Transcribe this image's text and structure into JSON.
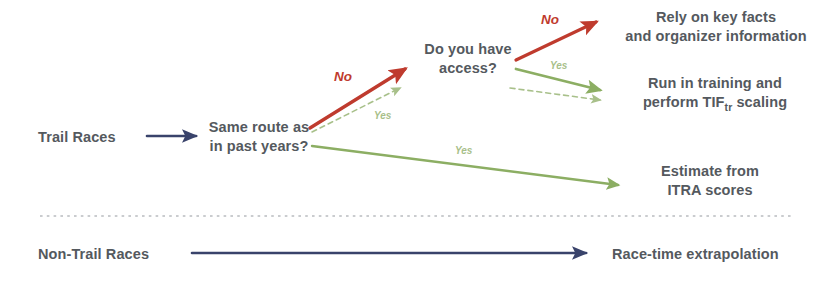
{
  "diagram": {
    "type": "flowchart",
    "colors": {
      "navy": "#39436b",
      "red": "#bf3b2e",
      "green": "#8cae63",
      "green_dashed": "#a8c08a",
      "text": "#54595e",
      "divider": "#b9bcc0",
      "background": "#ffffff"
    },
    "nodes": [
      {
        "id": "trail-races",
        "label": "Trail Races",
        "x": 38,
        "y": 128,
        "align": "left",
        "width": 120
      },
      {
        "id": "same-route",
        "label": "Same route as\nin past years?",
        "x": 198,
        "y": 118,
        "align": "center",
        "width": 122
      },
      {
        "id": "do-you-have-access",
        "label": "Do you have\naccess?",
        "x": 410,
        "y": 40,
        "align": "center",
        "width": 116
      },
      {
        "id": "rely-key-facts",
        "label": "Rely on key facts\nand organizer information",
        "x": 606,
        "y": 8,
        "align": "center",
        "width": 220
      },
      {
        "id": "run-in-training",
        "label": "Run in training and\nperform TIF",
        "label_suffix": " scaling",
        "label_sub": "tr",
        "x": 620,
        "y": 74,
        "align": "center",
        "width": 190
      },
      {
        "id": "estimate-itra",
        "label": "Estimate from\nITRA scores",
        "x": 630,
        "y": 162,
        "align": "center",
        "width": 160
      },
      {
        "id": "non-trail-races",
        "label": "Non-Trail Races",
        "x": 38,
        "y": 245,
        "align": "left",
        "width": 140
      },
      {
        "id": "race-time-extrap",
        "label": "Race-time extrapolation",
        "x": 612,
        "y": 245,
        "align": "left",
        "width": 210
      }
    ],
    "edges": [
      {
        "id": "trail-to-same-route",
        "from": "trail-races",
        "to": "same-route",
        "label": "",
        "color": "navy",
        "style": "solid",
        "x1": 147,
        "y1": 136,
        "x2": 196,
        "y2": 136,
        "width": 2.6
      },
      {
        "id": "same-route-no",
        "from": "same-route",
        "to": "do-you-have-access",
        "label": "No",
        "color": "red",
        "style": "solid",
        "x1": 310,
        "y1": 128,
        "x2": 405,
        "y2": 69,
        "width": 3.4
      },
      {
        "id": "same-route-yes-dashed",
        "from": "same-route",
        "to": "do-you-have-access",
        "label": "Yes",
        "color": "green_dashed",
        "style": "dashed",
        "x1": 312,
        "y1": 132,
        "x2": 400,
        "y2": 88,
        "width": 1.6
      },
      {
        "id": "same-route-yes-long",
        "from": "same-route",
        "to": "estimate-itra",
        "label": "Yes",
        "color": "green",
        "style": "solid",
        "x1": 312,
        "y1": 146,
        "x2": 618,
        "y2": 185,
        "width": 2.4
      },
      {
        "id": "access-no",
        "from": "do-you-have-access",
        "to": "rely-key-facts",
        "label": "No",
        "color": "red",
        "style": "solid",
        "x1": 516,
        "y1": 60,
        "x2": 596,
        "y2": 22,
        "width": 3.2
      },
      {
        "id": "access-yes",
        "from": "do-you-have-access",
        "to": "run-in-training",
        "label": "Yes",
        "color": "green",
        "style": "solid",
        "x1": 516,
        "y1": 69,
        "x2": 600,
        "y2": 90,
        "width": 2.8
      },
      {
        "id": "access-yes-dashed",
        "from": "do-you-have-access",
        "to": "run-in-training",
        "label": "",
        "color": "green_dashed",
        "style": "dashed",
        "x1": 510,
        "y1": 88,
        "x2": 600,
        "y2": 100,
        "width": 1.6
      },
      {
        "id": "non-trail-arrow",
        "from": "non-trail-races",
        "to": "race-time-extrap",
        "label": "",
        "color": "navy",
        "style": "solid",
        "x1": 192,
        "y1": 253,
        "x2": 586,
        "y2": 253,
        "width": 2.6
      }
    ],
    "edge_labels": [
      {
        "id": "label-no-1",
        "text": "No",
        "x": 334,
        "y": 69,
        "variant": "no-label"
      },
      {
        "id": "label-yes-dash1",
        "text": "Yes",
        "x": 374,
        "y": 110,
        "variant": "yes-label-small"
      },
      {
        "id": "label-yes-long",
        "text": "Yes",
        "x": 455,
        "y": 145,
        "variant": "yes-label-small"
      },
      {
        "id": "label-no-2",
        "text": "No",
        "x": 541,
        "y": 12,
        "variant": "no-label"
      },
      {
        "id": "label-yes-2",
        "text": "Yes",
        "x": 550,
        "y": 60,
        "variant": "yes-label-small"
      }
    ],
    "divider": {
      "id": "section-divider",
      "x1": 40,
      "y1": 216,
      "x2": 792,
      "y2": 216,
      "style": "dotted"
    }
  }
}
